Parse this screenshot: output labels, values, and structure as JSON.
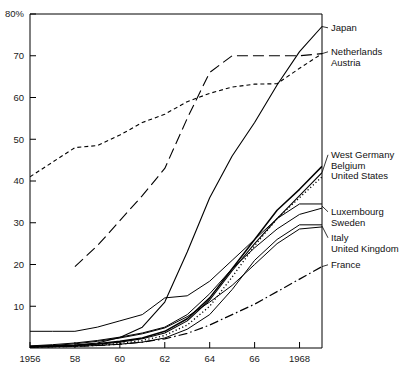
{
  "chart_data": {
    "type": "line",
    "title": "",
    "subtitle": "",
    "xlabel": "",
    "ylabel": "",
    "y_unit_label": "80%",
    "xlim": [
      1956,
      1969
    ],
    "ylim": [
      0,
      80
    ],
    "grid": false,
    "legend_position": "right-inline-labels",
    "x_tick_labels": [
      "1956",
      "58",
      "60",
      "62",
      "64",
      "66",
      "1968"
    ],
    "x_tick_values": [
      1956,
      1958,
      1960,
      1962,
      1964,
      1966,
      1968
    ],
    "y_tick_labels": [
      "10",
      "20",
      "30",
      "40",
      "50",
      "60",
      "70",
      "80%"
    ],
    "y_tick_values": [
      10,
      20,
      30,
      40,
      50,
      60,
      70,
      80
    ],
    "x": [
      1956,
      1957,
      1958,
      1959,
      1960,
      1961,
      1962,
      1963,
      1964,
      1965,
      1966,
      1967,
      1968,
      1969
    ],
    "series": [
      {
        "name": "Japan",
        "style": "solid",
        "width": 1.1,
        "label_y_value": 75,
        "values": [
          0.4,
          0.5,
          0.7,
          1.2,
          2.5,
          5.0,
          11.0,
          23.0,
          36.0,
          46.0,
          54.0,
          63.0,
          71.0,
          77.0
        ]
      },
      {
        "name": "Netherlands",
        "style": "longdash",
        "width": 1.1,
        "label_y_value": 70,
        "values": [
          null,
          null,
          19.5,
          24.5,
          30.5,
          36.5,
          43.0,
          55.0,
          66.0,
          70.0,
          70.0,
          70.0,
          70.0,
          70.5
        ]
      },
      {
        "name": "Austria",
        "style": "shortdash",
        "width": 1.1,
        "label_y_value": 65,
        "values": [
          41.0,
          44.5,
          48.0,
          48.5,
          51.0,
          54.0,
          56.0,
          59.0,
          61.0,
          62.5,
          63.2,
          63.3,
          67.0,
          70.5
        ]
      },
      {
        "name": "West Germany",
        "style": "solid",
        "width": 1.5,
        "label_y_value": 44,
        "values": [
          0.3,
          0.4,
          0.6,
          1.0,
          1.6,
          2.4,
          4.0,
          7.0,
          12.0,
          19.0,
          26.0,
          33.0,
          38.0,
          43.5
        ]
      },
      {
        "name": "Belgium",
        "style": "solid",
        "width": 1.1,
        "label_y_value": 41,
        "values": [
          0.3,
          0.4,
          0.6,
          0.9,
          1.4,
          2.2,
          3.6,
          6.5,
          11.5,
          18.5,
          25.0,
          31.0,
          36.5,
          42.0
        ]
      },
      {
        "name": "United States",
        "style": "dotted",
        "width": 1.3,
        "label_y_value": 38,
        "values": [
          0.2,
          0.3,
          0.4,
          0.7,
          1.1,
          1.8,
          3.0,
          5.5,
          10.0,
          17.0,
          24.5,
          31.0,
          36.0,
          41.0
        ]
      },
      {
        "name": "Luxembourg",
        "style": "solid",
        "width": 1.0,
        "label_y_value": 32.5,
        "values": [
          4.0,
          4.0,
          4.0,
          5.0,
          6.5,
          8.0,
          12.0,
          12.5,
          16.0,
          21.0,
          26.0,
          31.0,
          34.5,
          34.5
        ]
      },
      {
        "name": "Sweden",
        "style": "solid",
        "width": 1.0,
        "label_y_value": 29.5,
        "values": [
          0.5,
          0.8,
          1.2,
          1.8,
          2.6,
          3.6,
          5.0,
          8.0,
          13.0,
          19.0,
          24.0,
          28.5,
          32.0,
          33.5
        ]
      },
      {
        "name": "Italy",
        "style": "solid",
        "width": 1.0,
        "label_y_value": 25.5,
        "values": [
          0.2,
          0.3,
          0.4,
          0.6,
          0.9,
          1.4,
          2.4,
          4.5,
          8.0,
          14.0,
          21.0,
          26.0,
          29.5,
          29.5
        ]
      },
      {
        "name": "United Kingdom",
        "style": "solid",
        "width": 1.0,
        "label_y_value": 22.5,
        "values": [
          0.4,
          0.6,
          1.0,
          1.6,
          2.4,
          3.4,
          4.8,
          7.5,
          11.0,
          15.0,
          20.0,
          25.0,
          28.5,
          29.0
        ]
      },
      {
        "name": "France",
        "style": "dashdot",
        "width": 1.2,
        "label_y_value": 17,
        "values": [
          0.2,
          0.3,
          0.4,
          0.6,
          0.9,
          1.4,
          2.2,
          3.5,
          5.5,
          8.0,
          10.5,
          13.5,
          16.5,
          19.5
        ]
      }
    ],
    "label_groups": [
      {
        "labels": [
          "Japan"
        ],
        "anchor_y_value": 77
      },
      {
        "labels": [
          "Netherlands",
          "Austria"
        ],
        "anchor_y_value": 70.5
      },
      {
        "labels": [
          "West Germany",
          "Belgium",
          "United States"
        ],
        "anchor_y_value": 42
      },
      {
        "labels": [
          "Luxembourg",
          "Sweden"
        ],
        "anchor_y_value": 34
      },
      {
        "labels": [
          "Italy",
          "United Kingdom"
        ],
        "anchor_y_value": 29.2
      },
      {
        "labels": [
          "France"
        ],
        "anchor_y_value": 19.5
      }
    ]
  },
  "axes": {
    "y_top_label": "80%",
    "frame_color": "#000000"
  }
}
